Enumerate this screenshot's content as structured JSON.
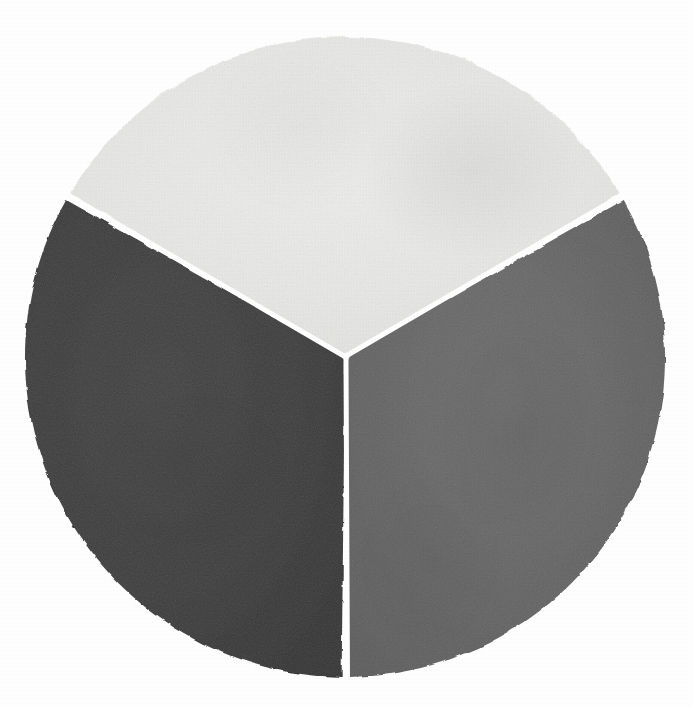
{
  "figure": {
    "title": "Three-sector painted pie chart",
    "medium": "hand-painted watercolor on textured paper",
    "background_color": "#ffffff"
  },
  "geometry": {
    "center_x": 345,
    "center_y": 357,
    "radius": 320,
    "gap_degrees": 1.2,
    "start_angle_degrees": -90
  },
  "chart_data": {
    "type": "pie",
    "title": "Three-sector painted pie chart",
    "subtitle": "",
    "xlabel": "",
    "ylabel": "",
    "legend_position": "none",
    "grid": false,
    "labels_shown": false,
    "categories": [
      "Top sector",
      "Left sector",
      "Right sector"
    ],
    "values": [
      33.3,
      33.3,
      33.3
    ],
    "units": "percent",
    "total": 100,
    "slices": [
      {
        "name": "Top sector",
        "value": 33.3,
        "percent": "33.3%",
        "color": "#e9e9e7",
        "tone": "light gray",
        "start_angle_degrees": -150,
        "end_angle_degrees": -30,
        "sweep_degrees": 120
      },
      {
        "name": "Left sector",
        "value": 33.3,
        "percent": "33.3%",
        "color": "#3c3c3c",
        "tone": "dark charcoal gray",
        "start_angle_degrees": 90,
        "end_angle_degrees": 210,
        "sweep_degrees": 120
      },
      {
        "name": "Right sector",
        "value": 33.3,
        "percent": "33.3%",
        "color": "#646464",
        "tone": "medium gray",
        "start_angle_degrees": -30,
        "end_angle_degrees": 90,
        "sweep_degrees": 120
      }
    ]
  },
  "palette": {
    "light_gray": "#e9e9e7",
    "dark_charcoal": "#3c3c3c",
    "medium_gray": "#646464",
    "paper_white": "#ffffff",
    "divider_white": "#fdfdfd"
  },
  "accessibility": {
    "description": "A circle painted on textured paper, divided into three equal 120 degree wedges separated by thin white gaps. The top wedge is near-white light gray, the lower-left wedge is dark charcoal, and the lower-right wedge is medium gray."
  }
}
